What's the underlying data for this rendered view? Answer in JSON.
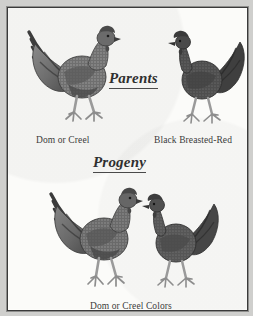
{
  "figure": {
    "title_parents": "Parents",
    "title_progeny": "Progeny",
    "background_color": "#cfcfcd",
    "paper_color": "#fbfbf9",
    "frame_color": "#3a3a3a",
    "ink_color": "#2f2f2f"
  },
  "parents": {
    "heading": "Parents",
    "birds": [
      {
        "id": "dom-or-creel",
        "caption": "Dom or Creel",
        "sex": "male",
        "facing": "right",
        "tone": "#6f6f6f"
      },
      {
        "id": "black-breasted-red",
        "caption": "Black Breasted-Red",
        "sex": "female",
        "facing": "left",
        "tone": "#4d4d4d"
      }
    ]
  },
  "progeny": {
    "heading": "Progeny",
    "caption": "Dom or Creel Colors",
    "birds": [
      {
        "id": "progeny-rooster",
        "sex": "male",
        "facing": "right",
        "tone": "#6a6a6a"
      },
      {
        "id": "progeny-hen",
        "sex": "female",
        "facing": "left",
        "tone": "#555555"
      }
    ]
  }
}
